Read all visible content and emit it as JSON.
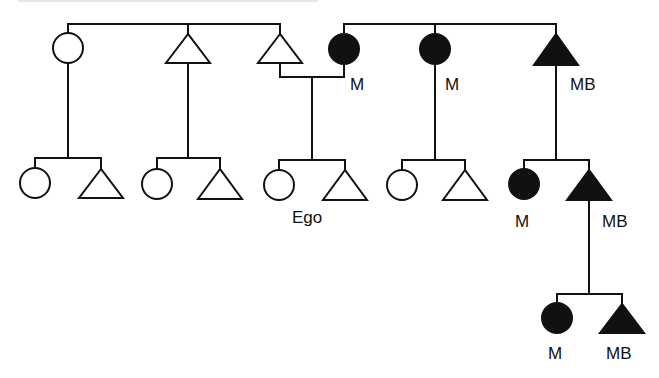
{
  "diagram": {
    "type": "kinship-chart",
    "stroke_color": "#111111",
    "fill_marked": "#111111",
    "fill_unmarked": "#ffffff",
    "legend_symbols": {
      "circle": "female",
      "triangle": "male",
      "filled": "marked lineage member"
    }
  },
  "generation1": {
    "left_sibset": [
      {
        "shape": "circle",
        "filled": false,
        "label": ""
      },
      {
        "shape": "triangle",
        "filled": false,
        "label": ""
      },
      {
        "shape": "triangle",
        "filled": false,
        "label": ""
      }
    ],
    "right_sibset": [
      {
        "shape": "circle",
        "filled": true,
        "label": "M"
      },
      {
        "shape": "circle",
        "filled": true,
        "label": "M"
      },
      {
        "shape": "triangle",
        "filled": true,
        "label": "MB"
      }
    ]
  },
  "generation2": [
    {
      "members": [
        {
          "shape": "circle",
          "filled": false,
          "label": ""
        },
        {
          "shape": "triangle",
          "filled": false,
          "label": ""
        }
      ]
    },
    {
      "members": [
        {
          "shape": "circle",
          "filled": false,
          "label": ""
        },
        {
          "shape": "triangle",
          "filled": false,
          "label": ""
        }
      ]
    },
    {
      "members": [
        {
          "shape": "circle",
          "filled": false,
          "label": ""
        },
        {
          "shape": "triangle",
          "filled": false,
          "label": ""
        }
      ],
      "ego_label": "Ego"
    },
    {
      "members": [
        {
          "shape": "circle",
          "filled": false,
          "label": ""
        },
        {
          "shape": "triangle",
          "filled": false,
          "label": ""
        }
      ]
    },
    {
      "members": [
        {
          "shape": "circle",
          "filled": true,
          "label": "M"
        },
        {
          "shape": "triangle",
          "filled": true,
          "label": "MB"
        }
      ]
    }
  ],
  "generation3": {
    "members": [
      {
        "shape": "circle",
        "filled": true,
        "label": "M"
      },
      {
        "shape": "triangle",
        "filled": true,
        "label": "MB"
      }
    ]
  },
  "labels": {
    "g1_m1": "M",
    "g1_m2": "M",
    "g1_mb": "MB",
    "ego": "Ego",
    "g2_m": "M",
    "g2_mb": "MB",
    "g3_m": "M",
    "g3_mb": "MB"
  }
}
